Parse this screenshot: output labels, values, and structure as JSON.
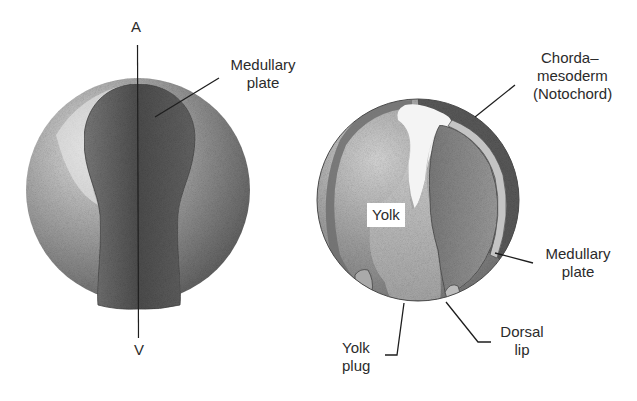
{
  "figure": {
    "left_embryo": {
      "axis": {
        "top_label": "A",
        "bottom_label": "V"
      },
      "labels": {
        "medullary_plate": {
          "line1": "Medullary",
          "line2": "plate"
        }
      }
    },
    "right_embryo": {
      "labels": {
        "chordamesoderm": {
          "line1": "Chorda–",
          "line2": "mesoderm",
          "line3": "(Notochord)"
        },
        "yolk": "Yolk",
        "medullary_plate": {
          "line1": "Medullary",
          "line2": "plate"
        },
        "dorsal_lip": {
          "line1": "Dorsal",
          "line2": "lip"
        },
        "yolk_plug": {
          "line1": "Yolk",
          "line2": "plug"
        }
      }
    },
    "colors": {
      "background": "#ffffff",
      "sphere_light": "#c9c9c9",
      "sphere_mid": "#8e8e8e",
      "sphere_dark": "#5e5e5e",
      "plate_dark": "#4a4a4a",
      "line": "#1e1e1e"
    }
  }
}
